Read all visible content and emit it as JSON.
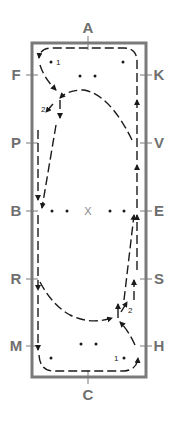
{
  "diagram": {
    "colors": {
      "border": "#7a7a7a",
      "letters": "#6f6f6f",
      "path": "#1a1a1a"
    },
    "markers": {
      "top": "A",
      "bottom": "C",
      "left": [
        "F",
        "P",
        "B",
        "R",
        "M"
      ],
      "right": [
        "K",
        "V",
        "E",
        "S",
        "H"
      ],
      "center": "X"
    },
    "numbers": {
      "one_top": "1",
      "two_top": "2",
      "one_bottom": "1",
      "two_bottom": "2"
    }
  }
}
